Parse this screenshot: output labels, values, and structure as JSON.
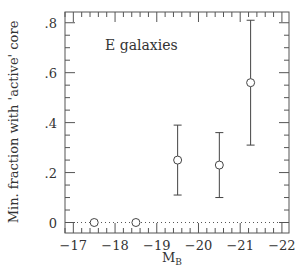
{
  "chart_data": {
    "type": "scatter",
    "title": "",
    "annotation": "E galaxies",
    "xlabel": "M",
    "xlabel_subscript": "B",
    "ylabel": "Min. fraction with 'active' core",
    "xlim": [
      -16.8,
      -22.17
    ],
    "ylim": [
      -0.042,
      0.843
    ],
    "x_ticks": [
      -17,
      -18,
      -19,
      -20,
      -21,
      -22
    ],
    "x_tick_labels": [
      "−17",
      "−18",
      "−19",
      "−20",
      "−21",
      "−22"
    ],
    "x_minor_step": 0.2,
    "y_ticks": [
      0,
      0.2,
      0.4,
      0.6,
      0.8
    ],
    "y_tick_labels": [
      "0",
      ".2",
      ".4",
      ".6",
      ".8"
    ],
    "y_minor_step": 0.05,
    "grid": false,
    "legend": null,
    "reference_line": {
      "y": 0,
      "style": "dotted"
    },
    "series": [
      {
        "name": "E galaxies",
        "marker": "open-circle",
        "points": [
          {
            "x": -17.5,
            "y": 0.0,
            "err_low": null,
            "err_high": null
          },
          {
            "x": -18.5,
            "y": 0.0,
            "err_low": null,
            "err_high": null
          },
          {
            "x": -19.5,
            "y": 0.25,
            "err_low": 0.11,
            "err_high": 0.39
          },
          {
            "x": -20.5,
            "y": 0.23,
            "err_low": 0.1,
            "err_high": 0.36
          },
          {
            "x": -21.25,
            "y": 0.56,
            "err_low": 0.31,
            "err_high": 0.81
          }
        ]
      }
    ],
    "colors": {
      "axes": "#555555",
      "markers": "#444444",
      "text": "#333333"
    }
  }
}
